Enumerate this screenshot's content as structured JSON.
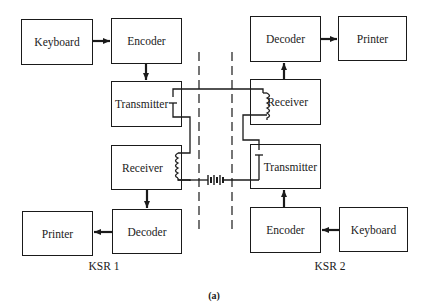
{
  "diagram": {
    "caption": "(a)",
    "ksr1": {
      "label": "KSR 1",
      "keyboard": "Keyboard",
      "encoder": "Encoder",
      "transmitter": "Transmitter",
      "receiver": "Receiver",
      "decoder": "Decoder",
      "printer": "Printer"
    },
    "ksr2": {
      "label": "KSR 2",
      "keyboard": "Keyboard",
      "encoder": "Encoder",
      "transmitter": "Transmitter",
      "receiver": "Receiver",
      "decoder": "Decoder",
      "printer": "Printer"
    },
    "line_color": "#1a1a1a",
    "components": [
      "contact-switch",
      "receiver-coil",
      "battery",
      "dashed-line-boundary"
    ]
  }
}
